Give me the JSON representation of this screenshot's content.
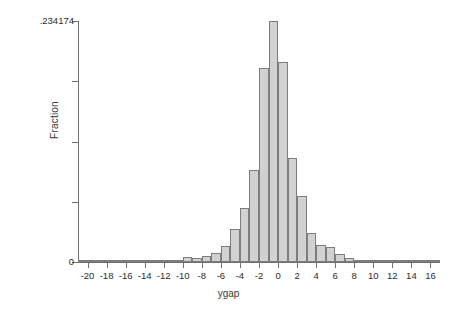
{
  "chart_data": {
    "type": "bar",
    "subtype": "histogram",
    "title": "",
    "xlabel": "ygap",
    "ylabel": "Fraction",
    "xlim": [
      -21,
      17
    ],
    "ylim": [
      0,
      0.234174
    ],
    "grid": false,
    "legend": null,
    "bar_color": "#d2d2d2",
    "bar_edge_color": "#7d7d7d",
    "axis_color": "#6f6f6f",
    "bin_width": 1,
    "xticks": [
      -20,
      -18,
      -16,
      -14,
      -12,
      -10,
      -8,
      -6,
      -4,
      -2,
      0,
      2,
      4,
      6,
      8,
      10,
      12,
      14,
      16
    ],
    "xtick_labels": [
      "-20",
      "-18",
      "-16",
      "-14",
      "-12",
      "-10",
      "-8",
      "-6",
      "-4",
      "-2",
      "0",
      "2",
      "4",
      "6",
      "8",
      "10",
      "12",
      "14",
      "16"
    ],
    "yticks": [
      0,
      0.0585435,
      0.117087,
      0.1756305,
      0.234174
    ],
    "ytick_labels": [
      "0",
      "",
      "",
      "",
      ".234174"
    ],
    "categories": [
      -20.5,
      -19.5,
      -18.5,
      -17.5,
      -16.5,
      -15.5,
      -14.5,
      -13.5,
      -12.5,
      -11.5,
      -10.5,
      -9.5,
      -8.5,
      -7.5,
      -6.5,
      -5.5,
      -4.5,
      -3.5,
      -2.5,
      -1.5,
      -0.5,
      0.5,
      1.5,
      2.5,
      3.5,
      4.5,
      5.5,
      6.5,
      7.5,
      8.5,
      9.5,
      10.5,
      11.5,
      12.5,
      13.5,
      14.5,
      15.5,
      16.5
    ],
    "values": [
      0.0012,
      0.0,
      0.0,
      0.0012,
      0.0,
      0.0012,
      0.0017,
      0.0017,
      0.0006,
      0.0012,
      0.0012,
      0.0047,
      0.0036,
      0.006,
      0.0083,
      0.0155,
      0.0316,
      0.0523,
      0.0897,
      0.1885,
      0.234174,
      0.1944,
      0.1012,
      0.0638,
      0.0283,
      0.0167,
      0.0143,
      0.0077,
      0.0036,
      0.0006,
      0.0006,
      0.0,
      0.0006,
      0.0,
      0.0012,
      0.0,
      0.0,
      0.0
    ]
  },
  "axis": {
    "y_top_label": ".234174",
    "y_zero_label": "0",
    "y_title": "Fraction",
    "x_title": "ygap"
  }
}
